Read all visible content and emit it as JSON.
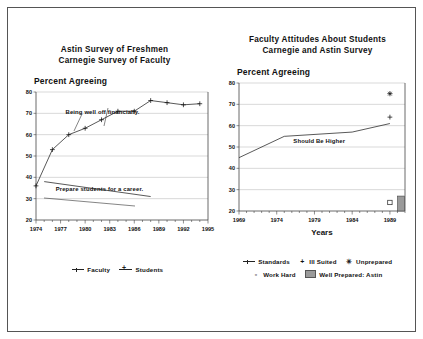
{
  "figure": {
    "background": "#ffffff",
    "border_color": "#555555",
    "accent": "#222222",
    "grid_color": "#b0b0b0",
    "bar_fill": "#9a9a9a"
  },
  "left_panel": {
    "title_line1": "Astin Survey of Freshmen",
    "title_line2": "Carnegie Survey of Faculty",
    "axis_caption": "Percent Agreeing",
    "legend": [
      {
        "marker": "line",
        "label": "Faculty"
      },
      {
        "marker": "plus-line",
        "label": "Students"
      }
    ]
  },
  "right_panel": {
    "title_line1": "Faculty Attitudes About Students",
    "title_line2": "Carnegie and Astin Survey",
    "axis_caption": "Percent Agreeing",
    "xlabel": "Years",
    "legend_row1": [
      {
        "marker": "line",
        "label": "Standards"
      },
      {
        "marker": "plus",
        "label": "Ill Suited"
      },
      {
        "marker": "asterisk",
        "label": "Unprepared"
      }
    ],
    "legend_row2": [
      {
        "marker": "square",
        "label": "Work Hard"
      },
      {
        "marker": "bar",
        "label": "Well Prepared: Astin"
      }
    ]
  },
  "chart_data": [
    {
      "id": "astin-freshmen-carnegie-faculty",
      "type": "line",
      "title": "Astin Survey of Freshmen / Carnegie Survey of Faculty",
      "xlabel": "",
      "ylabel": "Percent Agreeing",
      "xlim": [
        1974,
        1995
      ],
      "ylim": [
        20,
        80
      ],
      "yticks": [
        20,
        30,
        40,
        50,
        60,
        70,
        80
      ],
      "xticks": [
        1974,
        1977,
        1980,
        1983,
        1986,
        1989,
        1992,
        1995
      ],
      "grid": true,
      "legend_position": "below",
      "annotations": [
        {
          "text": "Being well off financially.",
          "x": 1977.6,
          "y": 69.5
        },
        {
          "text": "Prepare students for a career.",
          "x": 1976.4,
          "y": 33.6
        }
      ],
      "series": [
        {
          "name": "Students",
          "marker": "plus",
          "x": [
            1974,
            1976,
            1978,
            1980,
            1982,
            1984,
            1986,
            1988,
            1990,
            1992,
            1994
          ],
          "values": [
            36,
            53,
            60,
            63,
            67,
            71,
            71,
            76,
            75,
            74,
            74.5
          ]
        },
        {
          "name": "Faculty",
          "marker": "none",
          "x": [
            1975,
            1988
          ],
          "values": [
            38,
            31
          ]
        }
      ]
    },
    {
      "id": "faculty-attitudes-about-students",
      "type": "line",
      "title": "Faculty Attitudes About Students / Carnegie and Astin Survey",
      "xlabel": "Years",
      "ylabel": "Percent Agreeing",
      "xlim": [
        1969,
        1991
      ],
      "ylim": [
        20,
        80
      ],
      "yticks": [
        20,
        30,
        40,
        50,
        60,
        70,
        80
      ],
      "xticks": [
        1969,
        1974,
        1979,
        1984,
        1989
      ],
      "grid": true,
      "legend_position": "below",
      "annotations": [
        {
          "text": "Should Be Higher",
          "x": 1976.2,
          "y": 52.0
        }
      ],
      "series": [
        {
          "name": "Standards",
          "marker": "line",
          "x": [
            1969,
            1975,
            1984,
            1989
          ],
          "values": [
            45,
            55,
            57,
            61
          ]
        },
        {
          "name": "Ill Suited",
          "marker": "plus",
          "x": [
            1989
          ],
          "values": [
            64
          ]
        },
        {
          "name": "Unprepared",
          "marker": "asterisk",
          "x": [
            1989
          ],
          "values": [
            75
          ]
        },
        {
          "name": "Work Hard",
          "marker": "square",
          "x": [
            1989
          ],
          "values": [
            24
          ]
        },
        {
          "name": "Well Prepared: Astin",
          "marker": "bar",
          "x": [
            1991
          ],
          "values": [
            27
          ]
        }
      ]
    }
  ]
}
